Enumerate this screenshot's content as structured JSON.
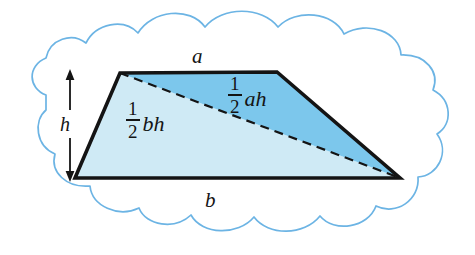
{
  "figure": {
    "labels": {
      "top_side": "a",
      "bottom_side": "b",
      "height": "h",
      "upper_triangle": {
        "numerator": "1",
        "denominator": "2",
        "tail": "ah"
      },
      "lower_triangle": {
        "numerator": "1",
        "denominator": "2",
        "tail": "bh"
      }
    },
    "colors": {
      "upper_triangle_fill": "#7cc7ec",
      "lower_triangle_fill": "#cfeaf5",
      "outline": "#141414",
      "cloud_stroke": "#6cb4e4",
      "background": "#ffffff"
    },
    "geometry": {
      "trapezoid_vertices": [
        [
          120,
          73
        ],
        [
          277,
          72
        ],
        [
          400,
          178
        ],
        [
          75,
          178
        ]
      ],
      "diagonal": [
        [
          120,
          73
        ],
        [
          400,
          178
        ]
      ],
      "height_arrow": {
        "x": 70,
        "y_top": 73,
        "y_bottom": 178
      }
    }
  }
}
